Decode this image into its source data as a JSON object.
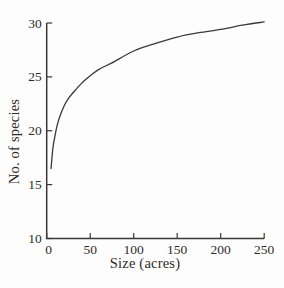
{
  "figure": {
    "background": "#fdfdfd",
    "ink_color": "#2f2b28",
    "axis_color": "#3c3835",
    "curve_color": "#3a3a3a"
  },
  "chart_data": {
    "type": "line",
    "title": "",
    "xlabel": "Size (acres)",
    "ylabel": "No. of species",
    "xlim": [
      0,
      250
    ],
    "ylim": [
      10,
      30
    ],
    "x_ticks": [
      0,
      50,
      100,
      150,
      200,
      250
    ],
    "y_ticks": [
      10,
      15,
      20,
      25,
      30
    ],
    "grid": false,
    "legend": false,
    "series": [
      {
        "name": "species-area-curve",
        "x": [
          5,
          7,
          9,
          12,
          15,
          20,
          25,
          30,
          40,
          50,
          60,
          75,
          100,
          125,
          150,
          175,
          200,
          225,
          250
        ],
        "y": [
          16.5,
          18.3,
          19.3,
          20.5,
          21.3,
          22.3,
          23.0,
          23.5,
          24.4,
          25.1,
          25.7,
          26.3,
          27.4,
          28.1,
          28.7,
          29.1,
          29.4,
          29.8,
          30.1
        ]
      }
    ]
  }
}
